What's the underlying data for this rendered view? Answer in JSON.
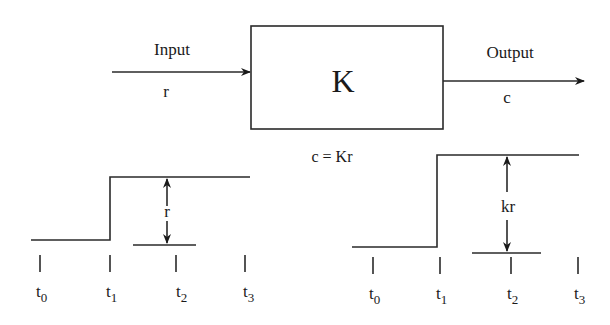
{
  "block": {
    "label": "K",
    "equation": "c = Kr"
  },
  "input": {
    "label": "Input",
    "symbol": "r"
  },
  "output": {
    "label": "Output",
    "symbol": "c"
  },
  "input_plot": {
    "amplitude_label": "r",
    "ticks": [
      {
        "base": "t",
        "sub": "0"
      },
      {
        "base": "t",
        "sub": "1"
      },
      {
        "base": "t",
        "sub": "2"
      },
      {
        "base": "t",
        "sub": "3"
      }
    ]
  },
  "output_plot": {
    "amplitude_label": "kr",
    "ticks": [
      {
        "base": "t",
        "sub": "0"
      },
      {
        "base": "t",
        "sub": "1"
      },
      {
        "base": "t",
        "sub": "2"
      },
      {
        "base": "t",
        "sub": "3"
      }
    ]
  },
  "colors": {
    "line": "#2a2a2a",
    "background": "#ffffff"
  }
}
